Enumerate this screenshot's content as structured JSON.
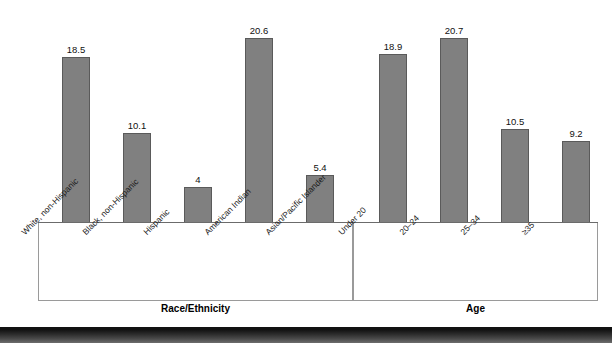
{
  "chart_data": {
    "type": "bar",
    "title": "",
    "xlabel": "",
    "ylabel": "",
    "ylim": [
      0,
      24
    ],
    "grid": false,
    "legend": "none",
    "orientation": "vertical",
    "bar_color": "#808080",
    "bar_edge_color": "#5a5a5a",
    "categories": [
      "White, non-Hispanic",
      "Black, non-Hispanic",
      "Hispanic",
      "American Indian",
      "Asian/Pacific Islander",
      "Under 20",
      "20–24",
      "25–34",
      "≥35"
    ],
    "values": [
      18.5,
      10.1,
      4,
      20.6,
      5.4,
      18.9,
      20.7,
      10.5,
      9.2
    ],
    "value_labels": [
      "18.5",
      "10.1",
      "4",
      "20.6",
      "5.4",
      "18.9",
      "20.7",
      "10.5",
      "9.2"
    ],
    "groups": [
      {
        "title": "Race/Ethnicity",
        "categories": [
          "White, non-Hispanic",
          "Black, non-Hispanic",
          "Hispanic",
          "American Indian",
          "Asian/Pacific Islander"
        ],
        "values": [
          18.5,
          10.1,
          4,
          20.6,
          5.4
        ]
      },
      {
        "title": "Age",
        "categories": [
          "Under 20",
          "20–24",
          "25–34",
          "≥35"
        ],
        "values": [
          18.9,
          20.7,
          10.5,
          9.2
        ]
      }
    ]
  },
  "groups": {
    "race": {
      "title": "Race/Ethnicity"
    },
    "age": {
      "title": "Age"
    }
  },
  "bars": [
    {
      "label": "White, non-Hispanic",
      "value_label": "18.5"
    },
    {
      "label": "Black, non-Hispanic",
      "value_label": "10.1"
    },
    {
      "label": "Hispanic",
      "value_label": "4"
    },
    {
      "label": "American Indian",
      "value_label": "20.6"
    },
    {
      "label": "Asian/Pacific Islander",
      "value_label": "5.4"
    },
    {
      "label": "Under 20",
      "value_label": "18.9"
    },
    {
      "label": "20–24",
      "value_label": "20.7"
    },
    {
      "label": "25–34",
      "value_label": "10.5"
    },
    {
      "label": "≥35",
      "value_label": "9.2"
    }
  ]
}
